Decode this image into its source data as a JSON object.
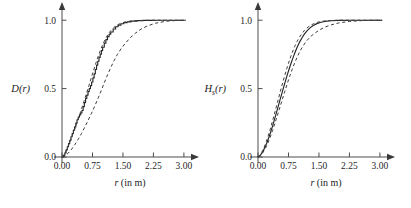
{
  "figure": {
    "background_color": "#ffffff",
    "panel_count": 2,
    "axis_color": "#4c4c4c",
    "curve_color": "#262626"
  },
  "chart_data": [
    {
      "type": "line",
      "title": "",
      "panel_id": "left",
      "xlabel": "r (in m)",
      "xlabel_italic_part": "r",
      "xlabel_rest": " (in m)",
      "ylabel": "D(r)",
      "ylabel_base": "D",
      "ylabel_subscript": "",
      "ylabel_arg": "(r)",
      "xlim": [
        0.0,
        3.15
      ],
      "ylim": [
        0.0,
        1.06
      ],
      "xticks": [
        0.0,
        0.75,
        1.5,
        2.25,
        3.0
      ],
      "xticklabels": [
        "0.00",
        "0.75",
        "1.50",
        "2.25",
        "3.00"
      ],
      "yticks": [
        0.0,
        0.5,
        1.0
      ],
      "yticklabels": [
        "0.0",
        "0.5",
        "1.0"
      ],
      "grid": false,
      "legend": "none",
      "axis_arrows": true,
      "series": [
        {
          "name": "empirical-cdf",
          "style": "solid",
          "x": [
            0.0,
            0.04,
            0.07,
            0.1,
            0.13,
            0.16,
            0.19,
            0.22,
            0.25,
            0.28,
            0.31,
            0.34,
            0.37,
            0.4,
            0.43,
            0.46,
            0.49,
            0.52,
            0.55,
            0.58,
            0.61,
            0.64,
            0.67,
            0.7,
            0.73,
            0.76,
            0.79,
            0.82,
            0.85,
            0.88,
            0.91,
            0.94,
            0.97,
            1.0,
            1.04,
            1.08,
            1.12,
            1.16,
            1.2,
            1.26,
            1.32,
            1.38,
            1.45,
            1.52,
            1.6,
            1.7,
            1.85,
            2.0,
            2.3,
            2.6,
            3.0
          ],
          "y": [
            0.0,
            0.012,
            0.03,
            0.052,
            0.075,
            0.098,
            0.122,
            0.148,
            0.172,
            0.196,
            0.22,
            0.248,
            0.272,
            0.292,
            0.308,
            0.322,
            0.34,
            0.368,
            0.398,
            0.428,
            0.452,
            0.478,
            0.5,
            0.522,
            0.548,
            0.578,
            0.608,
            0.64,
            0.672,
            0.7,
            0.728,
            0.752,
            0.778,
            0.802,
            0.832,
            0.858,
            0.88,
            0.898,
            0.914,
            0.936,
            0.952,
            0.964,
            0.974,
            0.982,
            0.988,
            0.993,
            0.997,
            0.999,
            1.0,
            1.0,
            1.0
          ],
          "stepped": true
        },
        {
          "name": "upper-envelope",
          "style": "dashed",
          "x": [
            0.0,
            0.06,
            0.12,
            0.18,
            0.24,
            0.3,
            0.36,
            0.42,
            0.48,
            0.54,
            0.6,
            0.66,
            0.72,
            0.78,
            0.84,
            0.9,
            0.96,
            1.02,
            1.08,
            1.14,
            1.2,
            1.28,
            1.36,
            1.45,
            1.55,
            1.68,
            1.85,
            2.05,
            2.35,
            2.7,
            3.05
          ],
          "y": [
            0.0,
            0.022,
            0.058,
            0.1,
            0.146,
            0.194,
            0.244,
            0.296,
            0.35,
            0.406,
            0.462,
            0.52,
            0.578,
            0.636,
            0.692,
            0.744,
            0.792,
            0.834,
            0.87,
            0.9,
            0.924,
            0.948,
            0.965,
            0.978,
            0.987,
            0.994,
            0.998,
            0.999,
            1.0,
            1.0,
            1.0
          ],
          "stepped": false
        },
        {
          "name": "lower-envelope",
          "style": "dashed",
          "x": [
            0.0,
            0.08,
            0.16,
            0.24,
            0.32,
            0.4,
            0.48,
            0.56,
            0.64,
            0.72,
            0.8,
            0.88,
            0.96,
            1.04,
            1.12,
            1.2,
            1.28,
            1.36,
            1.46,
            1.56,
            1.68,
            1.8,
            1.95,
            2.1,
            2.3,
            2.55,
            2.8,
            3.05
          ],
          "y": [
            0.0,
            0.01,
            0.03,
            0.058,
            0.092,
            0.13,
            0.172,
            0.218,
            0.266,
            0.316,
            0.368,
            0.424,
            0.482,
            0.542,
            0.6,
            0.654,
            0.704,
            0.748,
            0.794,
            0.832,
            0.872,
            0.904,
            0.936,
            0.958,
            0.978,
            0.992,
            0.998,
            1.0
          ],
          "stepped": false
        }
      ]
    },
    {
      "type": "line",
      "title": "",
      "panel_id": "right",
      "xlabel": "r (in m)",
      "xlabel_italic_part": "r",
      "xlabel_rest": " (in m)",
      "ylabel": "Hs(r)",
      "ylabel_base": "H",
      "ylabel_subscript": "s",
      "ylabel_arg": "(r)",
      "xlim": [
        0.0,
        3.15
      ],
      "ylim": [
        0.0,
        1.06
      ],
      "xticks": [
        0.0,
        0.75,
        1.5,
        2.25,
        3.0
      ],
      "xticklabels": [
        "0.00",
        "0.75",
        "1.50",
        "2.25",
        "3.00"
      ],
      "yticks": [
        0.0,
        0.5,
        1.0
      ],
      "yticklabels": [
        "0.0",
        "0.5",
        "1.0"
      ],
      "grid": false,
      "legend": "none",
      "axis_arrows": true,
      "series": [
        {
          "name": "empirical-cdf",
          "style": "solid",
          "x": [
            0.0,
            0.06,
            0.12,
            0.18,
            0.24,
            0.3,
            0.36,
            0.42,
            0.48,
            0.54,
            0.6,
            0.66,
            0.72,
            0.78,
            0.84,
            0.9,
            0.96,
            1.02,
            1.08,
            1.14,
            1.2,
            1.28,
            1.36,
            1.45,
            1.55,
            1.65,
            1.8,
            2.0,
            2.3,
            2.65,
            3.05
          ],
          "y": [
            0.0,
            0.014,
            0.04,
            0.076,
            0.12,
            0.172,
            0.228,
            0.29,
            0.352,
            0.416,
            0.478,
            0.54,
            0.6,
            0.656,
            0.708,
            0.756,
            0.8,
            0.838,
            0.87,
            0.898,
            0.92,
            0.944,
            0.961,
            0.975,
            0.985,
            0.991,
            0.996,
            0.999,
            1.0,
            1.0,
            1.0
          ],
          "stepped": false
        },
        {
          "name": "upper-envelope",
          "style": "dashed",
          "x": [
            0.0,
            0.06,
            0.12,
            0.18,
            0.24,
            0.3,
            0.36,
            0.42,
            0.48,
            0.54,
            0.6,
            0.66,
            0.72,
            0.78,
            0.84,
            0.9,
            0.96,
            1.02,
            1.08,
            1.14,
            1.2,
            1.28,
            1.36,
            1.45,
            1.55,
            1.65,
            1.78,
            1.95,
            2.25,
            2.6,
            3.05
          ],
          "y": [
            0.0,
            0.018,
            0.05,
            0.092,
            0.144,
            0.202,
            0.266,
            0.332,
            0.4,
            0.468,
            0.534,
            0.598,
            0.658,
            0.712,
            0.762,
            0.806,
            0.844,
            0.876,
            0.902,
            0.924,
            0.942,
            0.96,
            0.973,
            0.983,
            0.991,
            0.995,
            0.998,
            1.0,
            1.0,
            1.0,
            1.0
          ],
          "stepped": false
        },
        {
          "name": "lower-envelope",
          "style": "dashed",
          "x": [
            0.0,
            0.06,
            0.12,
            0.18,
            0.24,
            0.3,
            0.36,
            0.42,
            0.48,
            0.54,
            0.6,
            0.66,
            0.72,
            0.78,
            0.84,
            0.9,
            0.96,
            1.02,
            1.08,
            1.14,
            1.2,
            1.3,
            1.4,
            1.52,
            1.65,
            1.8,
            2.0,
            2.25,
            2.55,
            2.8,
            3.05
          ],
          "y": [
            0.0,
            0.01,
            0.032,
            0.062,
            0.1,
            0.145,
            0.195,
            0.25,
            0.306,
            0.364,
            0.422,
            0.48,
            0.536,
            0.59,
            0.64,
            0.686,
            0.728,
            0.766,
            0.798,
            0.826,
            0.85,
            0.882,
            0.906,
            0.93,
            0.95,
            0.966,
            0.981,
            0.991,
            0.997,
            0.999,
            1.0
          ],
          "stepped": false
        }
      ]
    }
  ]
}
